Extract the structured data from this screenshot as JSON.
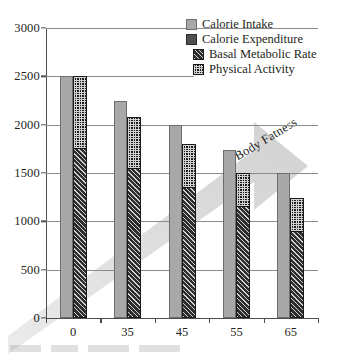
{
  "chart_data": {
    "type": "bar",
    "title": "",
    "xlabel": "",
    "ylabel": "",
    "categories": [
      "0",
      "35",
      "45",
      "55",
      "65"
    ],
    "ylim": [
      0,
      3000
    ],
    "yticks": [
      0,
      500,
      1000,
      1500,
      2000,
      2500,
      3000
    ],
    "grid": true,
    "legend_position": "top-right",
    "series": [
      {
        "name": "Calorie Intake",
        "values": [
          2500,
          2250,
          2000,
          1740,
          1500
        ],
        "color": "#a8a8a8",
        "pattern": "solid"
      },
      {
        "name": "Calorie Expenditure",
        "values": [
          2500,
          2080,
          1800,
          1500,
          1240
        ],
        "color": "#4f4f4f",
        "pattern": "solid",
        "note": "stacked total of Basal Metabolic Rate + Physical Activity"
      },
      {
        "name": "Basal Metabolic Rate",
        "values": [
          1750,
          1550,
          1350,
          1150,
          890
        ],
        "color": "#2e2e2e",
        "pattern": "diagonal-hatch"
      },
      {
        "name": "Physical Activity",
        "values": [
          750,
          530,
          450,
          350,
          350
        ],
        "color": "#1c1c1c",
        "pattern": "checker-dots",
        "note": "stacked above Basal Metabolic Rate"
      }
    ],
    "annotations": [
      {
        "text": "Body Fatness",
        "type": "arrow",
        "direction": "up-right",
        "color": "#d9d9d9"
      }
    ]
  },
  "legend": {
    "items": [
      {
        "label": "Calorie Intake",
        "swatch": "solid-light-gray"
      },
      {
        "label": "Calorie Expenditure",
        "swatch": "solid-dark-gray"
      },
      {
        "label": "Basal Metabolic Rate",
        "swatch": "diagonal-hatch"
      },
      {
        "label": "Physical Activity",
        "swatch": "checker-dots"
      }
    ]
  },
  "axes": {
    "y_tick_labels": [
      "3000",
      "2500",
      "2000",
      "1500",
      "1000",
      "500",
      "0"
    ],
    "x_tick_labels": [
      "0",
      "35",
      "45",
      "55",
      "65"
    ]
  }
}
